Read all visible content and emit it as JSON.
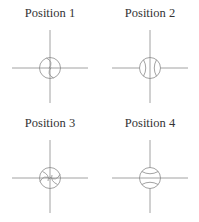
{
  "diagram": {
    "colors": {
      "line": "#8a8a8a",
      "text": "#333333",
      "background": "#ffffff"
    },
    "panels": [
      {
        "label": "Position 1",
        "seam_orientation": "diagonal-down-right"
      },
      {
        "label": "Position 2",
        "seam_orientation": "vertical"
      },
      {
        "label": "Position 3",
        "seam_orientation": "diagonal-up-right"
      },
      {
        "label": "Position 4",
        "seam_orientation": "horizontal"
      }
    ]
  }
}
